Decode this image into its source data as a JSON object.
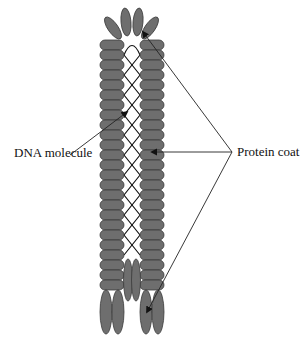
{
  "diagram": {
    "labels": {
      "dna": "DNA molecule",
      "protein_coat": "Protein coat"
    },
    "colors": {
      "segment_fill": "#6e6e6e",
      "segment_stroke": "#3a3a3a",
      "dna_stroke": "#111111",
      "pointer_line": "#222222"
    }
  }
}
